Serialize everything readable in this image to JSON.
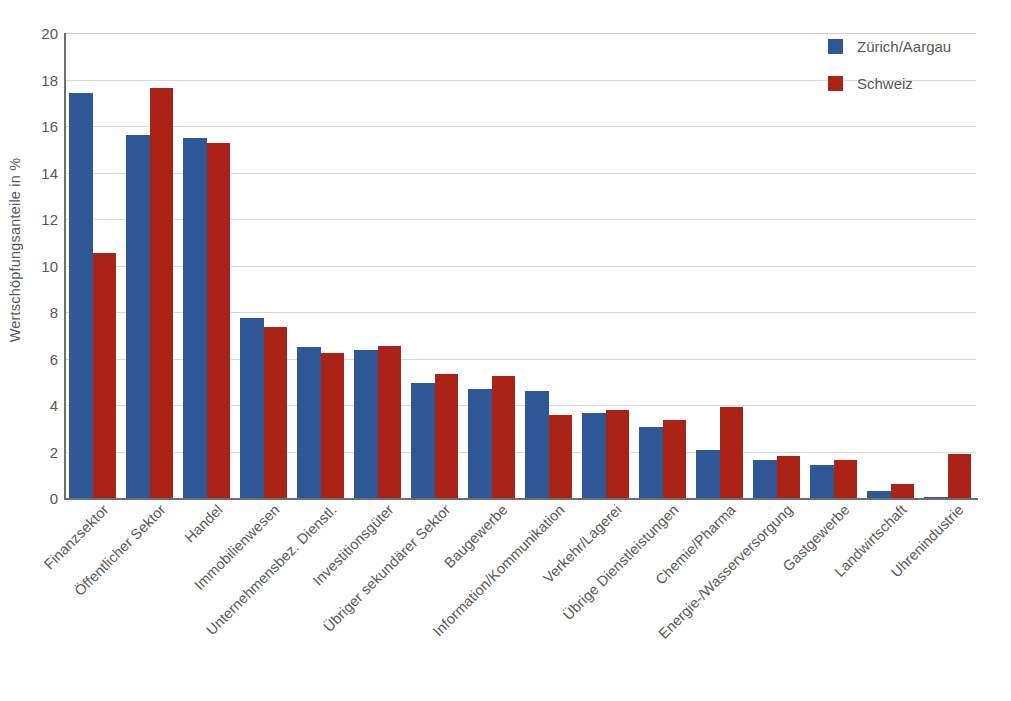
{
  "chart_data": {
    "type": "bar",
    "title": "",
    "subtitle": "",
    "xlabel": "",
    "ylabel": "Wertschöpfungsanteile in %",
    "ylim": [
      0,
      20
    ],
    "ytick_step": 2,
    "yticks": [
      "20",
      "18",
      "16",
      "14",
      "12",
      "10",
      "8",
      "6",
      "4",
      "2",
      "0"
    ],
    "grid": "horizontal",
    "legend_position": "top-right",
    "orientation": "vertical",
    "grouping": "grouped",
    "categories": [
      "Finanzsektor",
      "Öffentlicher Sektor",
      "Handel",
      "Immobilienwesen",
      "Unternehmensbez. Dienstl.",
      "Investitionsgüter",
      "Übriger sekundärer Sektor",
      "Baugewerbe",
      "Information/Kommunikation",
      "Verkehr/Lagerei",
      "Übrige Dienstleistungen",
      "Chemie/Pharma",
      "Energie-/Wasserversorgung",
      "Gastgewerbe",
      "Landwirtschaft",
      "Uhrenindustrie"
    ],
    "series": [
      {
        "name": "Zürich/Aargau",
        "color": "#2f5796",
        "values": [
          17.4,
          15.6,
          15.5,
          7.75,
          6.5,
          6.35,
          4.95,
          4.7,
          4.6,
          3.65,
          3.05,
          2.05,
          1.65,
          1.4,
          0.3,
          0.05
        ]
      },
      {
        "name": "Schweiz",
        "color": "#ab2317",
        "values": [
          10.55,
          17.65,
          15.25,
          7.35,
          6.25,
          6.55,
          5.35,
          5.25,
          3.55,
          3.8,
          3.35,
          3.9,
          1.8,
          1.65,
          0.6,
          1.9
        ]
      }
    ]
  },
  "legend": {
    "items": [
      {
        "label": "Zürich/Aargau",
        "color": "#2f5796"
      },
      {
        "label": "Schweiz",
        "color": "#ab2317"
      }
    ]
  },
  "axis": {
    "y_title": "Wertschöpfungsanteile in %"
  }
}
